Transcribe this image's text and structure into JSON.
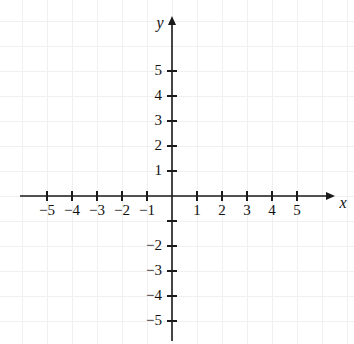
{
  "chart_data": {
    "type": "scatter",
    "title": "",
    "subtitle": "",
    "xlabel": "x",
    "ylabel": "y",
    "xlim": [
      -6.1,
      6.5
    ],
    "ylim": [
      -5.8,
      7.2
    ],
    "grid": true,
    "legend": null,
    "series": [],
    "x": [],
    "y": [],
    "annotations": [],
    "x_ticks": [
      -5,
      -4,
      -3,
      -2,
      -1,
      1,
      2,
      3,
      4,
      5
    ],
    "y_ticks": [
      5,
      4,
      3,
      2,
      1,
      -2,
      -3,
      -4,
      -5
    ],
    "x_tick_labels": [
      "−5",
      "−4",
      "−3",
      "−2",
      "−1",
      "1",
      "2",
      "3",
      "4",
      "5"
    ],
    "y_tick_labels": [
      "5",
      "4",
      "3",
      "2",
      "1",
      "−2",
      "−3",
      "−4",
      "−5"
    ],
    "unlabeled_ticks": {
      "y": [
        -1,
        0
      ],
      "x": [
        0
      ]
    },
    "colors": {
      "axis": "#1a1a1a",
      "grid": "#f0f0f0",
      "background": "#ffffff",
      "text": "#111111"
    }
  },
  "plot": {
    "origin": {
      "x": 172,
      "y": 196
    },
    "unit_px": 25,
    "x_axis": {
      "start": 20,
      "end": 335,
      "arrow": "right"
    },
    "y_axis": {
      "start": 16,
      "end": 341,
      "arrow": "up"
    },
    "tick_half_len": 5,
    "x_label_text": "x",
    "y_label_text": "y"
  }
}
